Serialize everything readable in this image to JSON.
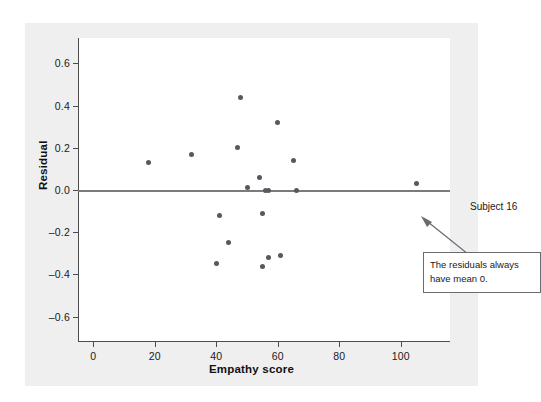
{
  "figure": {
    "panel_background": "#efeff0",
    "plot_background": "#ffffff",
    "axis_color": "#4c4c4c",
    "point_color": "#58585e",
    "zero_line_color": "#7a7a7f"
  },
  "annotations": {
    "subject_label": "Subject 16",
    "callout_text": "The residuals always have mean 0."
  },
  "chart_data": {
    "type": "scatter",
    "title": "",
    "xlabel": "Empathy score",
    "ylabel": "Residual",
    "xlim": [
      -5,
      116
    ],
    "ylim": [
      -0.72,
      0.72
    ],
    "xticks": [
      0,
      20,
      40,
      60,
      80,
      100
    ],
    "xtick_labels": [
      "0",
      "20",
      "40",
      "60",
      "80",
      "100"
    ],
    "yticks": [
      0.6,
      0.4,
      0.2,
      0.0,
      -0.2,
      -0.4,
      -0.6
    ],
    "ytick_labels": [
      "0.6",
      "0.4",
      "0.2",
      "0.0",
      "–0.2",
      "–0.4",
      "–0.6"
    ],
    "grid": false,
    "legend": "none",
    "reference_line": {
      "axis": "y",
      "value": 0.0
    },
    "x": [
      18,
      32,
      40,
      41,
      44,
      47,
      48,
      50,
      54,
      55,
      55,
      56,
      57,
      57,
      60,
      61,
      65,
      66,
      105
    ],
    "y": [
      0.13,
      0.17,
      -0.35,
      -0.12,
      -0.25,
      0.2,
      0.44,
      0.01,
      0.06,
      -0.36,
      -0.11,
      0.0,
      0.0,
      -0.32,
      0.32,
      -0.31,
      0.14,
      0.0,
      0.03
    ],
    "points": [
      {
        "x": 18,
        "y": 0.13
      },
      {
        "x": 32,
        "y": 0.17
      },
      {
        "x": 40,
        "y": -0.35
      },
      {
        "x": 41,
        "y": -0.12
      },
      {
        "x": 44,
        "y": -0.25
      },
      {
        "x": 47,
        "y": 0.2
      },
      {
        "x": 48,
        "y": 0.44
      },
      {
        "x": 50,
        "y": 0.01
      },
      {
        "x": 54,
        "y": 0.06
      },
      {
        "x": 55,
        "y": -0.36
      },
      {
        "x": 55,
        "y": -0.11
      },
      {
        "x": 56,
        "y": 0.0
      },
      {
        "x": 57,
        "y": 0.0
      },
      {
        "x": 57,
        "y": -0.32
      },
      {
        "x": 60,
        "y": 0.32
      },
      {
        "x": 61,
        "y": -0.31
      },
      {
        "x": 65,
        "y": 0.14
      },
      {
        "x": 66,
        "y": 0.0
      },
      {
        "x": 105,
        "y": 0.03
      }
    ]
  }
}
